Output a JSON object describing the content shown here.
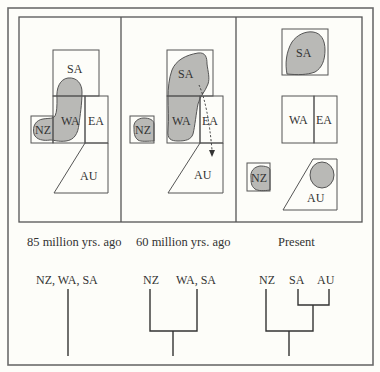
{
  "figure": {
    "panels": [
      {
        "caption": "85 million yrs. ago",
        "labels": {
          "sa": "SA",
          "wa": "WA",
          "ea": "EA",
          "nz": "NZ",
          "au": "AU"
        },
        "tree": {
          "tip_label": "NZ, WA, SA"
        }
      },
      {
        "caption": "60 million yrs. ago",
        "labels": {
          "sa": "SA",
          "wa": "WA",
          "ea": "EA",
          "nz": "NZ",
          "au": "AU"
        },
        "tree": {
          "tip_left": "NZ",
          "tip_right": "WA, SA"
        }
      },
      {
        "caption": "Present",
        "labels": {
          "sa": "SA",
          "wa": "WA",
          "ea": "EA",
          "nz": "NZ",
          "au": "AU"
        },
        "tree": {
          "tip_left": "NZ",
          "tip_mid": "SA",
          "tip_right": "AU"
        }
      }
    ],
    "colors": {
      "range_fill": "#b9b9b6",
      "line": "#555555",
      "background": "#fdfdf9"
    }
  }
}
